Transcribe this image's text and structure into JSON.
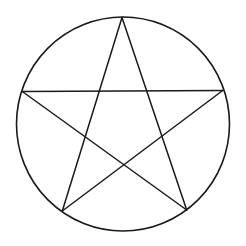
{
  "figure": {
    "stroke_color": "#1a1a1a",
    "background_color": "#ffffff",
    "circle": {
      "cx": 123,
      "cy": 124,
      "rx": 106.5,
      "ry": 107,
      "stroke_width": 1.6
    },
    "vertices": {
      "top": [
        122,
        17.5
      ],
      "left": [
        22.3,
        91.5
      ],
      "right": [
        222.7,
        90.5
      ],
      "bottom_left": [
        62.3,
        211
      ],
      "bottom_right": [
        186.7,
        210
      ]
    },
    "star_edges": [
      [
        "top",
        "bottom_left"
      ],
      [
        "top",
        "bottom_right"
      ],
      [
        "left",
        "right"
      ],
      [
        "left",
        "bottom_right"
      ],
      [
        "right",
        "bottom_left"
      ]
    ],
    "star_stroke_width": 1.5
  }
}
